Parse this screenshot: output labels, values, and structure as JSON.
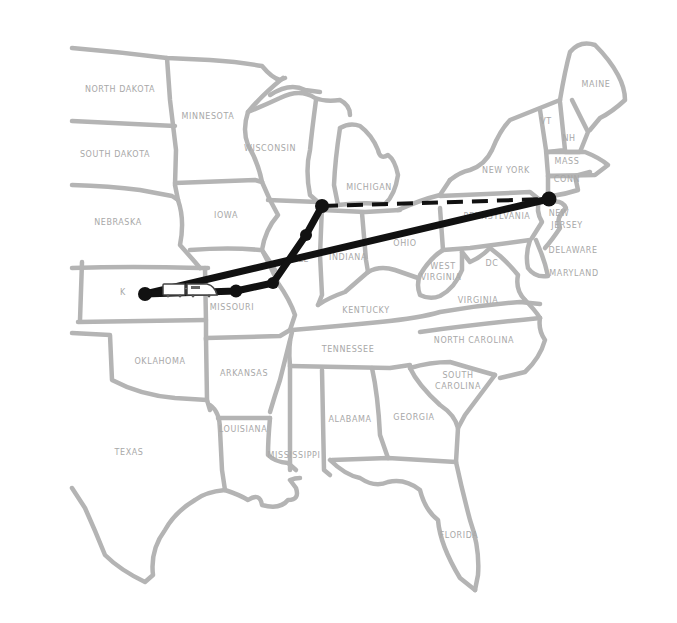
{
  "map": {
    "region": "Eastern and Central United States",
    "border_color": "#b4b4b4",
    "label_color": "#a8a8a8",
    "route_color": "#111111",
    "states": [
      {
        "id": "north-dakota",
        "label": "NORTH DAKOTA",
        "x": 120,
        "y": 92
      },
      {
        "id": "minnesota",
        "label": "MINNESOTA",
        "x": 208,
        "y": 119
      },
      {
        "id": "south-dakota",
        "label": "SOUTH DAKOTA",
        "x": 115,
        "y": 157
      },
      {
        "id": "wisconsin",
        "label": "WISCONSIN",
        "x": 270,
        "y": 151
      },
      {
        "id": "michigan",
        "label": "MICHIGAN",
        "x": 369,
        "y": 190
      },
      {
        "id": "nebraska",
        "label": "NEBRASKA",
        "x": 118,
        "y": 225
      },
      {
        "id": "iowa",
        "label": "IOWA",
        "x": 226,
        "y": 218
      },
      {
        "id": "illinois",
        "label": "ILL",
        "x": 302,
        "y": 262
      },
      {
        "id": "indiana",
        "label": "INDIANA",
        "x": 348,
        "y": 260
      },
      {
        "id": "ohio",
        "label": "OHIO",
        "x": 405,
        "y": 246
      },
      {
        "id": "kansas",
        "label": "K",
        "x": 123,
        "y": 295
      },
      {
        "id": "missouri",
        "label": "MISSOURI",
        "x": 232,
        "y": 310
      },
      {
        "id": "kentucky",
        "label": "KENTUCKY",
        "x": 366,
        "y": 313
      },
      {
        "id": "west-virginia-1",
        "label": "WEST",
        "x": 443,
        "y": 269
      },
      {
        "id": "west-virginia-2",
        "label": "VIRGINIA",
        "x": 441,
        "y": 280
      },
      {
        "id": "virginia",
        "label": "VIRGINIA",
        "x": 478,
        "y": 303
      },
      {
        "id": "oklahoma",
        "label": "OKLAHOMA",
        "x": 160,
        "y": 364
      },
      {
        "id": "arkansas",
        "label": "ARKANSAS",
        "x": 244,
        "y": 376
      },
      {
        "id": "tennessee",
        "label": "TENNESSEE",
        "x": 348,
        "y": 352
      },
      {
        "id": "north-carolina",
        "label": "NORTH CAROLINA",
        "x": 474,
        "y": 343
      },
      {
        "id": "south-carolina-1",
        "label": "SOUTH",
        "x": 458,
        "y": 378
      },
      {
        "id": "south-carolina-2",
        "label": "CAROLINA",
        "x": 458,
        "y": 389
      },
      {
        "id": "texas",
        "label": "TEXAS",
        "x": 129,
        "y": 455
      },
      {
        "id": "louisiana",
        "label": "LOUISIANA",
        "x": 243,
        "y": 432
      },
      {
        "id": "mississippi",
        "label": "MISSISSIPPI",
        "x": 294,
        "y": 458
      },
      {
        "id": "alabama",
        "label": "ALABAMA",
        "x": 350,
        "y": 422
      },
      {
        "id": "georgia",
        "label": "GEORGIA",
        "x": 414,
        "y": 420
      },
      {
        "id": "florida",
        "label": "FLORIDA",
        "x": 459,
        "y": 538
      },
      {
        "id": "new-york",
        "label": "NEW YORK",
        "x": 506,
        "y": 173
      },
      {
        "id": "pennsylvania",
        "label": "PENNSYLVANIA",
        "x": 497,
        "y": 219
      },
      {
        "id": "new-jersey-1",
        "label": "NEW",
        "x": 559,
        "y": 216
      },
      {
        "id": "new-jersey-2",
        "label": "JERSEY",
        "x": 567,
        "y": 228
      },
      {
        "id": "delaware",
        "label": "DELAWARE",
        "x": 573,
        "y": 253
      },
      {
        "id": "maryland",
        "label": "MARYLAND",
        "x": 574,
        "y": 276
      },
      {
        "id": "dc",
        "label": "DC",
        "x": 492,
        "y": 266
      },
      {
        "id": "maine",
        "label": "MAINE",
        "x": 596,
        "y": 87
      },
      {
        "id": "vermont",
        "label": "VT",
        "x": 546,
        "y": 124
      },
      {
        "id": "new-hampshire",
        "label": "NH",
        "x": 569,
        "y": 141
      },
      {
        "id": "massachusetts",
        "label": "MASS",
        "x": 567,
        "y": 164
      },
      {
        "id": "connecticut",
        "label": "CONN",
        "x": 567,
        "y": 182
      }
    ],
    "route": {
      "solid_segments": [
        {
          "from": "Kansas",
          "to": "New York City",
          "points": [
            [
              145,
              294
            ],
            [
              549,
              199
            ]
          ]
        },
        {
          "from": "Kansas",
          "to": "Missouri stop",
          "points": [
            [
              145,
              294
            ],
            [
              236,
              291
            ]
          ]
        },
        {
          "from": "Missouri stop",
          "to": "Michigan stop",
          "points": [
            [
              236,
              291
            ],
            [
              273,
              283
            ],
            [
              306,
              235
            ],
            [
              322,
              206
            ]
          ]
        }
      ],
      "dashed_segments": [
        {
          "from": "Michigan stop",
          "to": "New York City",
          "points": [
            [
              322,
              206
            ],
            [
              549,
              199
            ]
          ]
        }
      ],
      "stops": [
        {
          "name": "Kansas terminal",
          "x": 145,
          "y": 294
        },
        {
          "name": "Missouri stop",
          "x": 236,
          "y": 291
        },
        {
          "name": "Illinois south stop",
          "x": 273,
          "y": 283
        },
        {
          "name": "Illinois north stop",
          "x": 306,
          "y": 235
        },
        {
          "name": "Michigan stop",
          "x": 322,
          "y": 206
        },
        {
          "name": "East coast terminal",
          "x": 549,
          "y": 199
        }
      ],
      "vehicle": {
        "type": "train-icon",
        "x": 165,
        "y": 283
      }
    }
  }
}
